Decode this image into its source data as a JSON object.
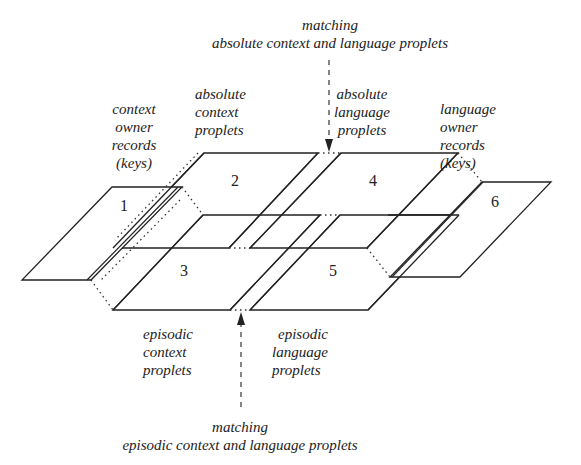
{
  "diagram": {
    "top_annotation": {
      "lines": [
        "matching",
        "absolute context and language proplets"
      ]
    },
    "bottom_annotation": {
      "lines": [
        "matching",
        "episodic context and language proplets"
      ]
    },
    "planes": [
      {
        "id": "1",
        "label_lines": [
          "context",
          "owner",
          "records",
          "(keys)"
        ]
      },
      {
        "id": "2",
        "label_lines": [
          "absolute",
          "context",
          "proplets"
        ]
      },
      {
        "id": "3",
        "label_lines": [
          "episodic",
          "context",
          "proplets"
        ]
      },
      {
        "id": "4",
        "label_lines": [
          "absolute",
          "language",
          "proplets"
        ]
      },
      {
        "id": "5",
        "label_lines": [
          "episodic",
          "language",
          "proplets"
        ]
      },
      {
        "id": "6",
        "label_lines": [
          "language",
          "owner",
          "records",
          "(keys)"
        ]
      }
    ],
    "colors": {
      "stroke": "#222222",
      "background": "#ffffff"
    }
  }
}
